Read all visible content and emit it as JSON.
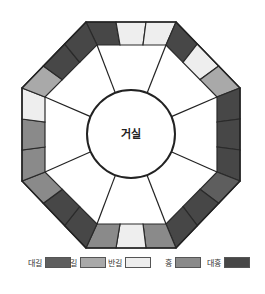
{
  "center_label": "거실",
  "colors": {
    "대길": "#5e5e5e",
    "길": "#a9a9a9",
    "반길": "#eeeeee",
    "흉": "#8a8a8a",
    "대흉": "#474747",
    "outline": "#2a2a2a"
  },
  "sides": [
    {
      "name": "top",
      "segments": [
        "대흉",
        "반길",
        "반길"
      ]
    },
    {
      "name": "top-right",
      "segments": [
        "대흉",
        "반길",
        "길"
      ]
    },
    {
      "name": "right",
      "segments": [
        "대흉",
        "대흉",
        "대흉"
      ]
    },
    {
      "name": "bottom-right",
      "segments": [
        "대길",
        "대흉",
        "대흉"
      ]
    },
    {
      "name": "bottom",
      "segments": [
        "흉",
        "반길",
        "흉"
      ]
    },
    {
      "name": "bottom-left",
      "segments": [
        "대흉",
        "대흉",
        "흉"
      ]
    },
    {
      "name": "left",
      "segments": [
        "흉",
        "흉",
        "반길"
      ]
    },
    {
      "name": "top-left",
      "segments": [
        "길",
        "대흉",
        "대흉"
      ]
    }
  ],
  "legend": [
    {
      "label": "대길",
      "key": "대길"
    },
    {
      "label": "길",
      "key": "길"
    },
    {
      "label": "반길",
      "key": "반길"
    },
    {
      "label": "흉",
      "key": "흉"
    },
    {
      "label": "대흉",
      "key": "대흉"
    }
  ]
}
